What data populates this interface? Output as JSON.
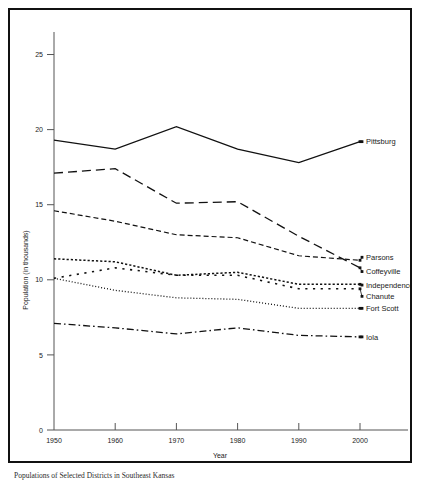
{
  "caption": "Populations of Selected Districts in Southeast Kansas",
  "chart_data": {
    "type": "line",
    "title": "",
    "xlabel": "Year",
    "ylabel": "Population (in thousands)",
    "x": [
      1950,
      1960,
      1970,
      1980,
      1990,
      2000
    ],
    "xtick_labels": [
      "1950",
      "1960",
      "1970",
      "1980",
      "1990",
      "2000"
    ],
    "ytick_labels": [
      "0",
      "5",
      "10",
      "15",
      "20",
      "25"
    ],
    "yticks": [
      0,
      5,
      10,
      15,
      20,
      25
    ],
    "ylim": [
      0,
      26.5
    ],
    "xlim": [
      1950,
      2005
    ],
    "grid": false,
    "legend_position": "right-inline-labels",
    "series": [
      {
        "name": "Pittsburg",
        "label": "Pittsburg",
        "dash": "solid",
        "values": [
          19.3,
          18.7,
          20.2,
          18.7,
          17.8,
          19.2
        ]
      },
      {
        "name": "Coffeyville",
        "label": "Coffeyville",
        "dash": "long-dash",
        "values": [
          17.1,
          17.4,
          15.1,
          15.2,
          12.9,
          10.8
        ]
      },
      {
        "name": "Parsons",
        "label": "Parsons",
        "dash": "dash",
        "values": [
          14.6,
          13.9,
          13.0,
          12.8,
          11.6,
          11.3
        ]
      },
      {
        "name": "Independence",
        "label": "Independence",
        "dash": "fine-dash",
        "values": [
          11.4,
          11.2,
          10.3,
          10.5,
          9.7,
          9.7
        ]
      },
      {
        "name": "Chanute",
        "label": "Chanute",
        "dash": "sparse-dash",
        "values": [
          10.1,
          10.8,
          10.3,
          10.3,
          9.4,
          9.4
        ]
      },
      {
        "name": "Fort Scott",
        "label": "Fort Scott",
        "dash": "dot",
        "values": [
          10.1,
          9.3,
          8.8,
          8.7,
          8.1,
          8.1
        ]
      },
      {
        "name": "Iola",
        "label": "Iola",
        "dash": "dash-dot",
        "values": [
          7.1,
          6.8,
          6.4,
          6.8,
          6.3,
          6.2
        ]
      }
    ]
  }
}
